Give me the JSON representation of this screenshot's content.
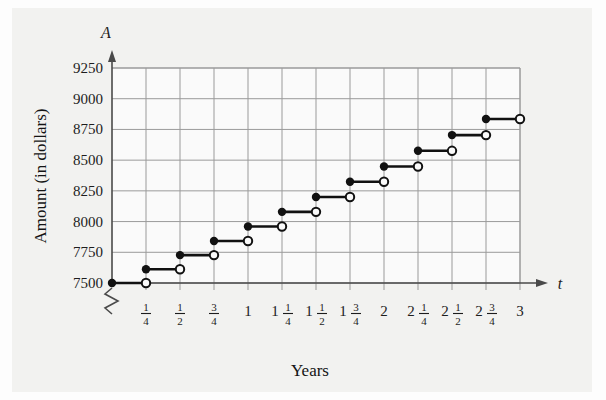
{
  "figure": {
    "background_color": "#f2f2f0",
    "plot_background_color": "#fafafa",
    "grid_color": "#9a9a9a",
    "axis_color": "#4a4a4a",
    "curve_color": "#111111"
  },
  "axes": {
    "y_variable": "A",
    "x_variable": "t",
    "y_axis_title": "Amount (in dollars)",
    "x_axis_title": "Years",
    "y_tick_labels": [
      "7500",
      "7750",
      "8000",
      "8250",
      "8500",
      "8750",
      "9000",
      "9250"
    ],
    "x_tick_labels": [
      {
        "whole": "",
        "num": "1",
        "den": "4"
      },
      {
        "whole": "",
        "num": "1",
        "den": "2"
      },
      {
        "whole": "",
        "num": "3",
        "den": "4"
      },
      {
        "whole": "1",
        "num": "",
        "den": ""
      },
      {
        "whole": "1",
        "num": "1",
        "den": "4"
      },
      {
        "whole": "1",
        "num": "1",
        "den": "2"
      },
      {
        "whole": "1",
        "num": "3",
        "den": "4"
      },
      {
        "whole": "2",
        "num": "",
        "den": ""
      },
      {
        "whole": "2",
        "num": "1",
        "den": "4"
      },
      {
        "whole": "2",
        "num": "1",
        "den": "2"
      },
      {
        "whole": "2",
        "num": "3",
        "den": "4"
      },
      {
        "whole": "3",
        "num": "",
        "den": ""
      }
    ],
    "y_axis_break": "zigzag",
    "y_axis_arrow": true,
    "x_axis_arrow": true
  },
  "chart_data": {
    "type": "line",
    "subtype": "step-function",
    "title": "",
    "xlabel": "Years",
    "ylabel": "Amount (in dollars)",
    "xlim": [
      0,
      3
    ],
    "ylim": [
      7500,
      9250
    ],
    "grid": true,
    "legend": null,
    "x_tick_values": [
      0.25,
      0.5,
      0.75,
      1,
      1.25,
      1.5,
      1.75,
      2,
      2.25,
      2.5,
      2.75,
      3
    ],
    "y_tick_values": [
      7500,
      7750,
      8000,
      8250,
      8500,
      8750,
      9000,
      9250
    ],
    "steps": [
      {
        "x_start": 0,
        "x_end": 0.25,
        "value": 7500,
        "left_endpoint": "closed",
        "right_endpoint": "open"
      },
      {
        "x_start": 0.25,
        "x_end": 0.5,
        "value": 7612,
        "left_endpoint": "closed",
        "right_endpoint": "open"
      },
      {
        "x_start": 0.5,
        "x_end": 0.75,
        "value": 7727,
        "left_endpoint": "closed",
        "right_endpoint": "open"
      },
      {
        "x_start": 0.75,
        "x_end": 1,
        "value": 7842,
        "left_endpoint": "closed",
        "right_endpoint": "open"
      },
      {
        "x_start": 1,
        "x_end": 1.25,
        "value": 7960,
        "left_endpoint": "closed",
        "right_endpoint": "open"
      },
      {
        "x_start": 1.25,
        "x_end": 1.5,
        "value": 8079,
        "left_endpoint": "closed",
        "right_endpoint": "open"
      },
      {
        "x_start": 1.5,
        "x_end": 1.75,
        "value": 8200,
        "left_endpoint": "closed",
        "right_endpoint": "open"
      },
      {
        "x_start": 1.75,
        "x_end": 2,
        "value": 8324,
        "left_endpoint": "closed",
        "right_endpoint": "open"
      },
      {
        "x_start": 2,
        "x_end": 2.25,
        "value": 8448,
        "left_endpoint": "closed",
        "right_endpoint": "open"
      },
      {
        "x_start": 2.25,
        "x_end": 2.5,
        "value": 8576,
        "left_endpoint": "closed",
        "right_endpoint": "open"
      },
      {
        "x_start": 2.5,
        "x_end": 2.75,
        "value": 8704,
        "left_endpoint": "closed",
        "right_endpoint": "open"
      },
      {
        "x_start": 2.75,
        "x_end": 3,
        "value": 8835,
        "left_endpoint": "closed",
        "right_endpoint": "open"
      }
    ]
  }
}
